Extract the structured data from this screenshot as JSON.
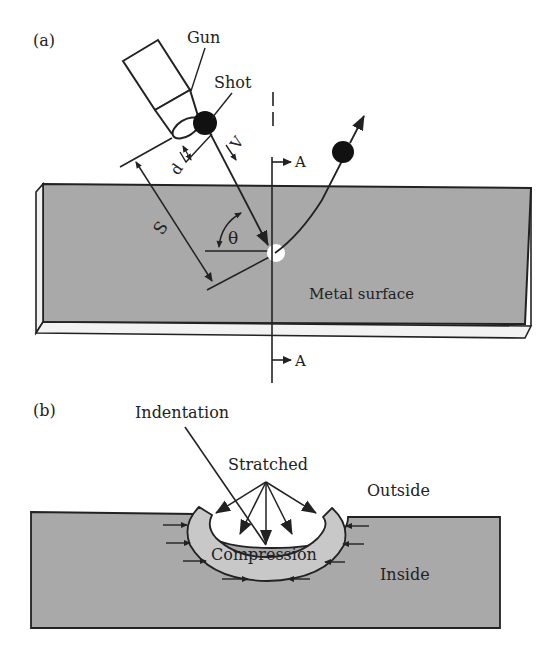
{
  "panel_a": {
    "label": "(a)",
    "gun_label": "Gun",
    "shot_label": "Shot",
    "d_label": "d",
    "v_label": "V",
    "s_label": "S",
    "theta_label": "θ",
    "section_top": "A",
    "section_bottom": "A",
    "surface_label": "Metal surface"
  },
  "panel_b": {
    "label": "(b)",
    "indentation_label": "Indentation",
    "stretched_label": "Stratched",
    "outside_label": "Outside",
    "inside_label": "Inside",
    "compression_label": "Compression"
  },
  "colors": {
    "metal_fill": "#a9a9a9",
    "compression_fill": "#c8c8c8",
    "stroke": "#222222",
    "background": "#ffffff"
  }
}
